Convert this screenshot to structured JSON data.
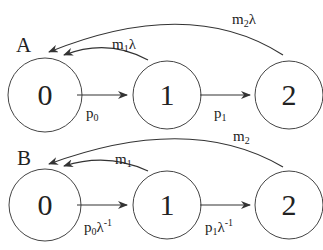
{
  "panels": [
    {
      "label": "A",
      "nodes": [
        {
          "id": "0",
          "label": "0"
        },
        {
          "id": "1",
          "label": "1"
        },
        {
          "id": "2",
          "label": "2"
        }
      ],
      "edges": [
        {
          "from": "0",
          "to": "1",
          "base": "p",
          "sub": "0",
          "suffix": "",
          "sup": ""
        },
        {
          "from": "1",
          "to": "2",
          "base": "p",
          "sub": "1",
          "suffix": "",
          "sup": ""
        },
        {
          "from": "1",
          "to": "0",
          "base": "m",
          "sub": "1",
          "suffix": "λ",
          "sup": ""
        },
        {
          "from": "2",
          "to": "0",
          "base": "m",
          "sub": "2",
          "suffix": "λ",
          "sup": ""
        }
      ]
    },
    {
      "label": "B",
      "nodes": [
        {
          "id": "0",
          "label": "0"
        },
        {
          "id": "1",
          "label": "1"
        },
        {
          "id": "2",
          "label": "2"
        }
      ],
      "edges": [
        {
          "from": "0",
          "to": "1",
          "base": "p",
          "sub": "0",
          "suffix": "λ",
          "sup": "-1"
        },
        {
          "from": "1",
          "to": "2",
          "base": "p",
          "sub": "1",
          "suffix": "λ",
          "sup": "-1"
        },
        {
          "from": "1",
          "to": "0",
          "base": "m",
          "sub": "1",
          "suffix": "",
          "sup": ""
        },
        {
          "from": "2",
          "to": "0",
          "base": "m",
          "sub": "2",
          "suffix": "",
          "sup": ""
        }
      ]
    }
  ],
  "colors": {
    "stroke": "#333333",
    "text": "#222222",
    "background": "#ffffff"
  }
}
